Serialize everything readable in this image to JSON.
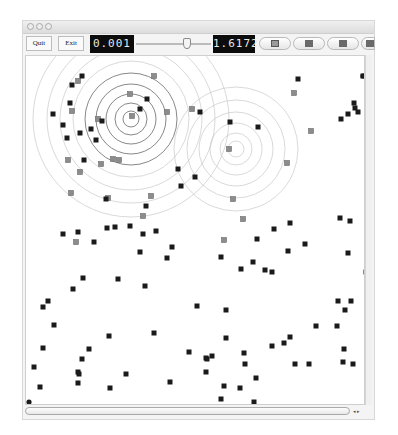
{
  "window": {
    "traffic_lights": [
      "close",
      "minimize",
      "zoom"
    ]
  },
  "toolbar": {
    "quit_label": "Quit",
    "exit_label": "Exit",
    "left_display": "0.001",
    "right_display": "1.6172",
    "slider_position_pct": 62,
    "pill_buttons": [
      {
        "name": "pill-button-1",
        "icon": "outlined-square-icon"
      },
      {
        "name": "pill-button-2",
        "icon": "square-icon"
      },
      {
        "name": "pill-button-3",
        "icon": "square-icon"
      },
      {
        "name": "pill-button-4",
        "icon": "square-icon"
      }
    ]
  },
  "canvas": {
    "colors": {
      "dark_point": "#1a1a1a",
      "grey_point": "#8c8c8c",
      "ring": "#bfbfbf",
      "ring_dark": "#555555"
    },
    "ripple_centers": [
      {
        "x": 105,
        "y": 63,
        "rings": [
          8,
          16,
          25,
          35,
          46,
          58,
          71,
          84,
          98
        ]
      },
      {
        "x": 210,
        "y": 93,
        "rings": [
          8,
          16,
          26,
          37,
          49,
          62
        ]
      }
    ],
    "dark_points": [
      [
        56,
        20
      ],
      [
        46,
        29
      ],
      [
        121,
        43
      ],
      [
        76,
        65
      ],
      [
        65,
        73
      ],
      [
        54,
        77
      ],
      [
        37,
        178
      ],
      [
        52,
        176
      ],
      [
        81,
        172
      ],
      [
        68,
        186
      ],
      [
        89,
        171
      ],
      [
        104,
        170
      ],
      [
        130,
        175
      ],
      [
        114,
        196
      ],
      [
        141,
        202
      ],
      [
        146,
        191
      ],
      [
        17,
        251
      ],
      [
        22,
        245
      ],
      [
        28,
        269
      ],
      [
        195,
        201
      ],
      [
        227,
        206
      ],
      [
        215,
        213
      ],
      [
        231,
        183
      ],
      [
        264,
        167
      ],
      [
        248,
        173
      ],
      [
        262,
        195
      ],
      [
        279,
        188
      ],
      [
        314,
        162
      ],
      [
        324,
        165
      ],
      [
        322,
        197
      ],
      [
        340,
        216
      ],
      [
        325,
        245
      ],
      [
        312,
        245
      ],
      [
        311,
        270
      ],
      [
        319,
        254
      ],
      [
        200,
        254
      ],
      [
        171,
        250
      ],
      [
        128,
        277
      ],
      [
        57,
        222
      ],
      [
        92,
        223
      ],
      [
        119,
        230
      ],
      [
        47,
        233
      ],
      [
        83,
        280
      ],
      [
        63,
        293
      ],
      [
        163,
        296
      ],
      [
        186,
        300
      ],
      [
        180,
        302
      ],
      [
        200,
        282
      ],
      [
        218,
        297
      ],
      [
        246,
        290
      ],
      [
        258,
        287
      ],
      [
        264,
        281
      ],
      [
        219,
        308
      ],
      [
        181,
        303
      ],
      [
        180,
        316
      ],
      [
        239,
        214
      ],
      [
        246,
        216
      ],
      [
        290,
        270
      ],
      [
        318,
        293
      ],
      [
        327,
        308
      ],
      [
        56,
        303
      ],
      [
        52,
        316
      ],
      [
        17,
        292
      ],
      [
        8,
        311
      ],
      [
        14,
        331
      ],
      [
        53,
        318
      ],
      [
        84,
        332
      ],
      [
        52,
        327
      ],
      [
        100,
        318
      ],
      [
        144,
        326
      ],
      [
        195,
        343
      ],
      [
        214,
        332
      ],
      [
        230,
        322
      ],
      [
        269,
        308
      ],
      [
        283,
        308
      ],
      [
        317,
        306
      ],
      [
        228,
        346
      ],
      [
        198,
        330
      ],
      [
        337,
        20
      ],
      [
        329,
        52
      ],
      [
        332,
        56
      ],
      [
        322,
        58
      ],
      [
        328,
        47
      ],
      [
        272,
        23
      ],
      [
        315,
        63
      ],
      [
        204,
        66
      ],
      [
        174,
        56
      ],
      [
        232,
        71
      ],
      [
        155,
        130
      ],
      [
        80,
        143
      ],
      [
        120,
        150
      ],
      [
        117,
        178
      ],
      [
        114,
        53
      ],
      [
        70,
        84
      ],
      [
        152,
        113
      ],
      [
        169,
        121
      ],
      [
        58,
        104
      ],
      [
        37,
        69
      ],
      [
        44,
        47
      ],
      [
        27,
        58
      ],
      [
        41,
        82
      ]
    ],
    "grey_points": [
      [
        104,
        38
      ],
      [
        52,
        25
      ],
      [
        46,
        55
      ],
      [
        72,
        63
      ],
      [
        106,
        60
      ],
      [
        128,
        20
      ],
      [
        166,
        53
      ],
      [
        141,
        56
      ],
      [
        42,
        104
      ],
      [
        87,
        103
      ],
      [
        54,
        116
      ],
      [
        82,
        142
      ],
      [
        75,
        108
      ],
      [
        45,
        137
      ],
      [
        93,
        104
      ],
      [
        203,
        93
      ],
      [
        268,
        37
      ],
      [
        285,
        75
      ],
      [
        261,
        107
      ],
      [
        207,
        143
      ],
      [
        217,
        163
      ],
      [
        198,
        184
      ],
      [
        50,
        186
      ],
      [
        125,
        140
      ],
      [
        117,
        160
      ]
    ],
    "round_points": [
      [
        337,
        20
      ],
      [
        3,
        346
      ]
    ]
  },
  "scrollbars": {
    "horizontal_arrows": "◂ ▸"
  }
}
